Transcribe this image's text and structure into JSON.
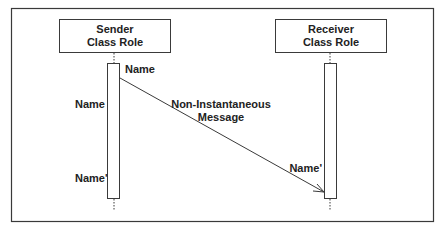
{
  "diagram": {
    "type": "uml-sequence-diagram",
    "colors": {
      "stroke": "#3a3a3a",
      "text": "#222222",
      "background": "#ffffff"
    },
    "sender": {
      "line1": "Sender",
      "line2": "Class Role"
    },
    "receiver": {
      "line1": "Receiver",
      "line2": "Class Role"
    },
    "labels": {
      "send_event": "Name",
      "sender_start": "Name",
      "sender_end": "Name'",
      "receive_event": "Name'"
    },
    "message": {
      "line1": "Non-Instantaneous",
      "line2": "Message"
    }
  }
}
